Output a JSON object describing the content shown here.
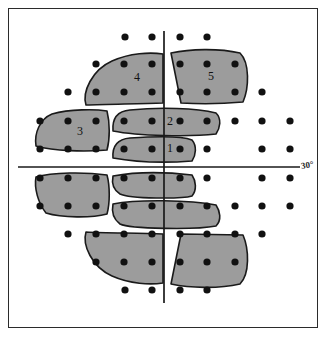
{
  "figure": {
    "axis_label": "30°",
    "frame_color": "#2b2b2b",
    "zone_fill_color": "#9c9c9c",
    "zone_stroke_color": "#1a1a1a",
    "dot_color": "#111111",
    "background_color": "#ffffff"
  },
  "chart_data": {
    "type": "scatter",
    "xlabel": "",
    "ylabel": "",
    "annotations": [
      "30°"
    ],
    "grid": false,
    "legend": "none",
    "axes": {
      "vertical_meridian_x": 164,
      "horizontal_meridian_y": 167,
      "horizontal_line_x_range": [
        18,
        300
      ],
      "vertical_line_y_range": [
        31,
        303
      ]
    },
    "zone_labels": [
      {
        "label": "1",
        "x": 170,
        "y": 148
      },
      {
        "label": "2",
        "x": 170,
        "y": 121
      },
      {
        "label": "3",
        "x": 80,
        "y": 131
      },
      {
        "label": "4",
        "x": 137,
        "y": 77
      },
      {
        "label": "5",
        "x": 211,
        "y": 76
      }
    ],
    "dot_rows": [
      {
        "y": 37,
        "xs": [
          125,
          152,
          180,
          207
        ]
      },
      {
        "y": 64,
        "xs": [
          96,
          124,
          152,
          180,
          207,
          235
        ]
      },
      {
        "y": 92,
        "xs": [
          68,
          96,
          124,
          152,
          180,
          207,
          235,
          262
        ]
      },
      {
        "y": 121,
        "xs": [
          40,
          68,
          96,
          124,
          152,
          180,
          207,
          235,
          262,
          290
        ]
      },
      {
        "y": 149,
        "xs": [
          40,
          68,
          96,
          124,
          152,
          180,
          207,
          262,
          290
        ]
      },
      {
        "y": 178,
        "xs": [
          40,
          68,
          96,
          124,
          152,
          180,
          207,
          262,
          290
        ]
      },
      {
        "y": 206,
        "xs": [
          40,
          68,
          96,
          124,
          152,
          180,
          207,
          235,
          262,
          290
        ]
      },
      {
        "y": 234,
        "xs": [
          68,
          96,
          124,
          152,
          180,
          207,
          235,
          262
        ]
      },
      {
        "y": 262,
        "xs": [
          96,
          124,
          152,
          180,
          207,
          235
        ]
      },
      {
        "y": 290,
        "xs": [
          125,
          152,
          180,
          207
        ]
      }
    ],
    "zone_count": 5,
    "shaded_region_count": 10
  }
}
